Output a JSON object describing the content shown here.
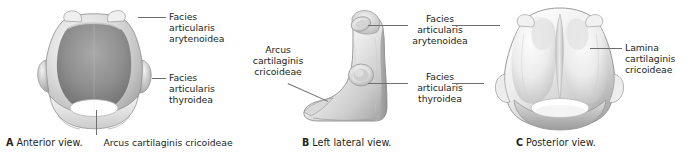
{
  "figure": {
    "background_color": "#ffffff",
    "text_color": "#231f20",
    "leader_color": "#6e6e72"
  },
  "panels": [
    {
      "id": "a",
      "letter": "A",
      "caption": "Anterior view.",
      "specimen": "cricoid-cartilage-anterior",
      "labels": [
        {
          "name": "facies-articularis-arytenoidea",
          "text": "Facies\narticularis\narytenoidea"
        },
        {
          "name": "facies-articularis-thyroidea",
          "text": "Facies\narticularis\nthyroidea"
        },
        {
          "name": "arcus-cartilaginis-cricoideae",
          "text": "Arcus cartilaginis cricoideae"
        }
      ]
    },
    {
      "id": "b",
      "letter": "B",
      "caption": "Left lateral view.",
      "specimen": "cricoid-cartilage-left-lateral",
      "labels": [
        {
          "name": "arcus-cartilaginis-cricoideae",
          "text": "Arcus\ncartilaginis\ncricoideae"
        },
        {
          "name": "facies-articularis-arytenoidea",
          "text": "Facies\narticularis\narytenoidea"
        },
        {
          "name": "facies-articularis-thyroidea",
          "text": "Facies\narticularis\nthyroidea"
        }
      ]
    },
    {
      "id": "c",
      "letter": "C",
      "caption": "Posterior view.",
      "specimen": "cricoid-cartilage-posterior",
      "labels": [
        {
          "name": "lamina-cartilaginis-cricoideae",
          "text": "Lamina cartilaginis\ncricoideae"
        }
      ]
    }
  ]
}
